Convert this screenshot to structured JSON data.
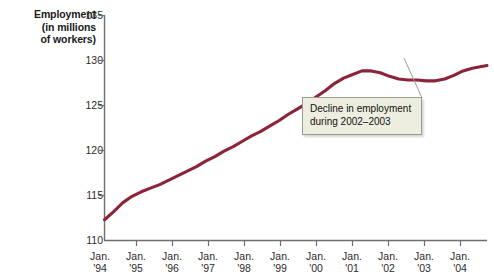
{
  "chart_data": {
    "type": "line",
    "title": "",
    "xlabel": "",
    "ylabel": "Employment (in millions of workers)",
    "ylim": [
      110,
      135
    ],
    "yticks": [
      110,
      115,
      120,
      125,
      130,
      135
    ],
    "xlim": [
      "Jan. '94",
      "Jan. '04"
    ],
    "xticks": [
      "Jan. '94",
      "Jan. '95",
      "Jan. '96",
      "Jan. '97",
      "Jan. '98",
      "Jan. '99",
      "Jan. '00",
      "Jan. '01",
      "Jan. '02",
      "Jan. '03",
      "Jan. '04"
    ],
    "grid": false,
    "legend": "none",
    "series": [
      {
        "name": "Employment",
        "color": "#8b2438",
        "x": [
          1994.0,
          1994.25,
          1994.5,
          1994.75,
          1995.0,
          1995.25,
          1995.5,
          1995.75,
          1996.0,
          1996.25,
          1996.5,
          1996.75,
          1997.0,
          1997.25,
          1997.5,
          1997.75,
          1998.0,
          1998.25,
          1998.5,
          1998.75,
          1999.0,
          1999.25,
          1999.5,
          1999.75,
          2000.0,
          2000.25,
          2000.5,
          2000.75,
          2001.0,
          2001.25,
          2001.5,
          2001.75,
          2002.0,
          2002.25,
          2002.5,
          2002.75,
          2003.0,
          2003.25,
          2003.5,
          2003.75,
          2004.0,
          2004.4
        ],
        "values": [
          112.3,
          113.2,
          114.2,
          114.9,
          115.4,
          115.8,
          116.2,
          116.7,
          117.2,
          117.7,
          118.2,
          118.8,
          119.3,
          119.9,
          120.4,
          121.0,
          121.6,
          122.1,
          122.7,
          123.3,
          124.0,
          124.6,
          125.2,
          125.9,
          126.6,
          127.4,
          128.0,
          128.4,
          128.8,
          128.8,
          128.6,
          128.2,
          127.9,
          127.8,
          127.8,
          127.7,
          127.7,
          127.9,
          128.3,
          128.8,
          129.1,
          129.4
        ]
      }
    ],
    "annotations": [
      {
        "text_line1": "Decline in employment",
        "text_line2": "during 2002–2003",
        "points_to": "2002-2003 decline"
      }
    ]
  },
  "chart": {
    "y_axis_title": {
      "line1": "Employment",
      "line2": "(in millions",
      "line3": "of workers)"
    },
    "y_tick_labels": [
      "135",
      "130",
      "125",
      "120",
      "115",
      "110"
    ],
    "x_tick_labels": [
      {
        "month": "Jan.",
        "year": "'94"
      },
      {
        "month": "Jan.",
        "year": "'95"
      },
      {
        "month": "Jan.",
        "year": "'96"
      },
      {
        "month": "Jan.",
        "year": "'97"
      },
      {
        "month": "Jan.",
        "year": "'98"
      },
      {
        "month": "Jan.",
        "year": "'99"
      },
      {
        "month": "Jan.",
        "year": "'00"
      },
      {
        "month": "Jan.",
        "year": "'01"
      },
      {
        "month": "Jan.",
        "year": "'02"
      },
      {
        "month": "Jan.",
        "year": "'03"
      },
      {
        "month": "Jan.",
        "year": "'04"
      }
    ],
    "callout": {
      "line1": "Decline in employment",
      "line2": "during 2002–2003"
    },
    "colors": {
      "line": "#8b2438",
      "axis": "#6e6e6e",
      "callout_fill": "#eeeee0",
      "callout_border": "#9a9a94",
      "leader": "#9b9b9b"
    }
  }
}
